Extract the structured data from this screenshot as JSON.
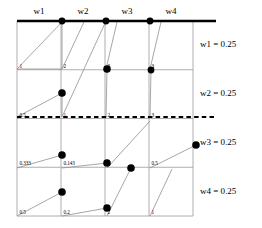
{
  "figure": {
    "type": "grid-slope-diagram",
    "grid": {
      "rows": 4,
      "cols": 4,
      "left": 17,
      "top": 21,
      "right": 193,
      "bottom": 216
    },
    "column_headers": [
      {
        "label": "w1"
      },
      {
        "label": "w2"
      },
      {
        "label": "w3"
      },
      {
        "label": "w4"
      }
    ],
    "row_labels": [
      {
        "label": "w1 = 0.25"
      },
      {
        "label": "w2 = 0.25"
      },
      {
        "label": "w3 = 0.25"
      },
      {
        "label": "w4 = 0.25"
      }
    ],
    "cell_values": [
      [
        "1",
        "2",
        "3",
        "3"
      ],
      [
        "0.5",
        "1",
        "2",
        "3"
      ],
      [
        "0.333",
        "0.143",
        "1",
        "0.5"
      ],
      [
        "0.5",
        "0.2",
        "2",
        "1"
      ]
    ],
    "dots": [
      {
        "x": 62,
        "y": 21,
        "r": 3.4
      },
      {
        "x": 106,
        "y": 21,
        "r": 3.4
      },
      {
        "x": 150,
        "y": 21,
        "r": 3.4
      },
      {
        "x": 107,
        "y": 69,
        "r": 3.8
      },
      {
        "x": 151,
        "y": 70,
        "r": 3.4
      },
      {
        "x": 62,
        "y": 93,
        "r": 3.8
      },
      {
        "x": 196,
        "y": 145,
        "r": 3.8
      },
      {
        "x": 62,
        "y": 155,
        "r": 3.8
      },
      {
        "x": 107,
        "y": 163,
        "r": 3.8
      },
      {
        "x": 131,
        "y": 168,
        "r": 3.8
      },
      {
        "x": 62,
        "y": 192,
        "r": 3.8
      },
      {
        "x": 107,
        "y": 208,
        "r": 3.8
      }
    ],
    "slope_lines": [
      {
        "x1": 17,
        "y1": 69,
        "x2": 62,
        "y2": 22
      },
      {
        "x1": 17,
        "y1": 69,
        "x2": 62,
        "y2": 69
      },
      {
        "x1": 62,
        "y1": 69,
        "x2": 62,
        "y2": 22
      },
      {
        "x1": 62,
        "y1": 69,
        "x2": 84,
        "y2": 22
      },
      {
        "x1": 62,
        "y1": 117,
        "x2": 106,
        "y2": 21
      },
      {
        "x1": 106,
        "y1": 69,
        "x2": 117,
        "y2": 22
      },
      {
        "x1": 106,
        "y1": 117,
        "x2": 107,
        "y2": 69
      },
      {
        "x1": 150,
        "y1": 69,
        "x2": 161,
        "y2": 22
      },
      {
        "x1": 150,
        "y1": 117,
        "x2": 151,
        "y2": 70
      },
      {
        "x1": 17,
        "y1": 117,
        "x2": 62,
        "y2": 93
      },
      {
        "x1": 62,
        "y1": 117,
        "x2": 62,
        "y2": 93
      },
      {
        "x1": 17,
        "y1": 168,
        "x2": 62,
        "y2": 155
      },
      {
        "x1": 62,
        "y1": 168,
        "x2": 107,
        "y2": 163
      },
      {
        "x1": 107,
        "y1": 168,
        "x2": 150,
        "y2": 121
      },
      {
        "x1": 150,
        "y1": 168,
        "x2": 196,
        "y2": 145
      },
      {
        "x1": 17,
        "y1": 216,
        "x2": 62,
        "y2": 192
      },
      {
        "x1": 62,
        "y1": 216,
        "x2": 107,
        "y2": 208
      },
      {
        "x1": 107,
        "y1": 216,
        "x2": 131,
        "y2": 168
      },
      {
        "x1": 150,
        "y1": 216,
        "x2": 172,
        "y2": 169
      }
    ],
    "dashed_line": {
      "y": 117
    },
    "top_border": {
      "y": 21
    },
    "colors": {
      "ink": "#000000",
      "grid": "#9a9a9a",
      "thin": "#8f8f8f"
    }
  }
}
